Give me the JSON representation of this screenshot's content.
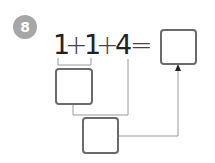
{
  "problem": {
    "number": "8",
    "equation": {
      "tokens": [
        "1",
        "+",
        "1",
        "+",
        "4",
        "="
      ]
    },
    "boxes": [
      {
        "id": "result-box",
        "value": ""
      },
      {
        "id": "partial-sum-box",
        "value": ""
      },
      {
        "id": "second-sum-box",
        "value": ""
      }
    ]
  },
  "colors": {
    "badge": "#a6a6a6",
    "box_border": "#6b6b6b",
    "line": "#9a9a9a",
    "text": "#222222"
  }
}
